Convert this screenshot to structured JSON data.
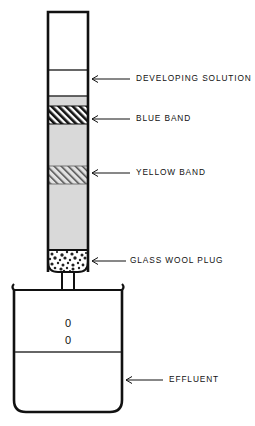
{
  "figure": {
    "colors": {
      "outline": "#111111",
      "packing_fill": "#d9d9d9",
      "blue_band_hatch": "#111111",
      "yellow_band_hatch": "#555555",
      "plug_speckle": "#222222",
      "background": "#ffffff",
      "liquid_line": "#333333"
    }
  },
  "labels": [
    {
      "id": "developing-solution",
      "text": "DEVELOPING SOLUTION",
      "arrow_tip_x": 92,
      "arrow_tail_x": 130,
      "y": 79,
      "text_x": 136
    },
    {
      "id": "blue-band",
      "text": "BLUE BAND",
      "arrow_tip_x": 92,
      "arrow_tail_x": 130,
      "y": 119,
      "text_x": 136
    },
    {
      "id": "yellow-band",
      "text": "YELLOW BAND",
      "arrow_tip_x": 92,
      "arrow_tail_x": 130,
      "y": 173,
      "text_x": 136
    },
    {
      "id": "glass-wool-plug",
      "text": "GLASS WOOL PLUG",
      "arrow_tip_x": 92,
      "arrow_tail_x": 126,
      "y": 261,
      "text_x": 130
    },
    {
      "id": "effluent",
      "text": "EFFLUENT",
      "arrow_tip_x": 126,
      "arrow_tail_x": 163,
      "y": 380,
      "text_x": 169
    }
  ],
  "column": {
    "name": "chromatography-column",
    "left": 48,
    "right": 88,
    "top": 12,
    "packing_top": 96,
    "plug_top": 250,
    "bottom": 272,
    "headspace_line_y": 70,
    "stem": {
      "left": 62,
      "right": 74,
      "top": 272,
      "tip_y": 307
    }
  },
  "bands": [
    {
      "id": "blue-band-region",
      "top": 106,
      "bottom": 124,
      "hatch": "dense-forward"
    },
    {
      "id": "yellow-band-region",
      "top": 166,
      "bottom": 184,
      "hatch": "light-forward"
    }
  ],
  "beaker": {
    "name": "effluent-beaker",
    "left": 14,
    "right": 122,
    "rim_y": 290,
    "bottom_y": 412,
    "liquid_level_y": 352,
    "spout_side": "left"
  },
  "drops": [
    {
      "id": "drop-upper",
      "glyph": "0",
      "x": 68,
      "y": 324
    },
    {
      "id": "drop-lower",
      "glyph": "0",
      "x": 68,
      "y": 341
    }
  ]
}
